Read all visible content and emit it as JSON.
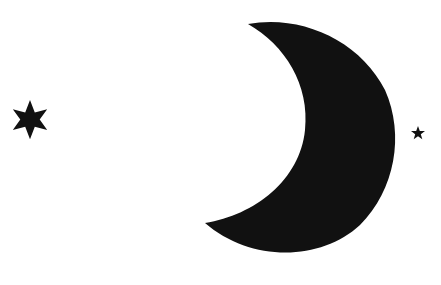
{
  "scene": {
    "background": "#ffffff",
    "fill": "#111111",
    "elements": [
      {
        "type": "seven-point-star",
        "label": "large star"
      },
      {
        "type": "crescent-moon",
        "label": "crescent moon"
      },
      {
        "type": "five-point-star",
        "label": "small star"
      }
    ]
  }
}
